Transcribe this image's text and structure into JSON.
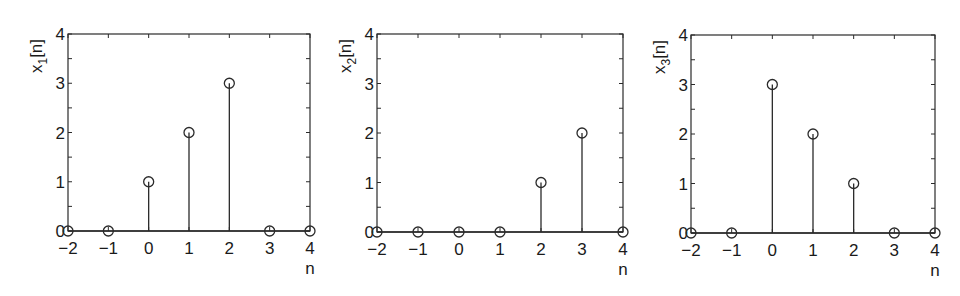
{
  "chart_data": [
    {
      "type": "stem",
      "title": "",
      "xlabel": "n",
      "ylabel": "x1[n]",
      "ylabel_base": "x",
      "ylabel_sub": "1",
      "ylabel_suffix": "[n]",
      "x": [
        -2,
        -1,
        0,
        1,
        2,
        3,
        4
      ],
      "values": [
        0,
        0,
        1,
        2,
        3,
        0,
        0
      ],
      "xlim": [
        -2,
        4
      ],
      "ylim": [
        0,
        4
      ],
      "xticks": [
        "-2",
        "-1",
        "0",
        "1",
        "2",
        "3",
        "4"
      ],
      "yticks": [
        "0",
        "1",
        "2",
        "3",
        "4"
      ],
      "grid": false,
      "legend": null,
      "frame": {
        "left": 68,
        "top": 34,
        "right": 310,
        "bottom": 231
      }
    },
    {
      "type": "stem",
      "title": "",
      "xlabel": "n",
      "ylabel": "x2[n]",
      "ylabel_base": "x",
      "ylabel_sub": "2",
      "ylabel_suffix": "[n]",
      "x": [
        -2,
        -1,
        0,
        1,
        2,
        3,
        4
      ],
      "values": [
        0,
        0,
        0,
        0,
        1,
        2,
        0
      ],
      "xlim": [
        -2,
        4
      ],
      "ylim": [
        0,
        4
      ],
      "xticks": [
        "-2",
        "-1",
        "0",
        "1",
        "2",
        "3",
        "4"
      ],
      "yticks": [
        "0",
        "1",
        "2",
        "3",
        "4"
      ],
      "grid": false,
      "legend": null,
      "frame": {
        "left": 377,
        "top": 34,
        "right": 623,
        "bottom": 232
      }
    },
    {
      "type": "stem",
      "title": "",
      "xlabel": "n",
      "ylabel": "x3[n]",
      "ylabel_base": "x",
      "ylabel_sub": "3",
      "ylabel_suffix": "[n]",
      "x": [
        -2,
        -1,
        0,
        1,
        2,
        3,
        4
      ],
      "values": [
        0,
        0,
        3,
        2,
        1,
        0,
        0
      ],
      "xlim": [
        -2,
        4
      ],
      "ylim": [
        0,
        4
      ],
      "xticks": [
        "-2",
        "-1",
        "0",
        "1",
        "2",
        "3",
        "4"
      ],
      "yticks": [
        "0",
        "1",
        "2",
        "3",
        "4"
      ],
      "grid": false,
      "legend": null,
      "frame": {
        "left": 691,
        "top": 35,
        "right": 935,
        "bottom": 233
      }
    }
  ],
  "colors": {
    "ink": "#2a2a2a",
    "background": "#ffffff"
  }
}
